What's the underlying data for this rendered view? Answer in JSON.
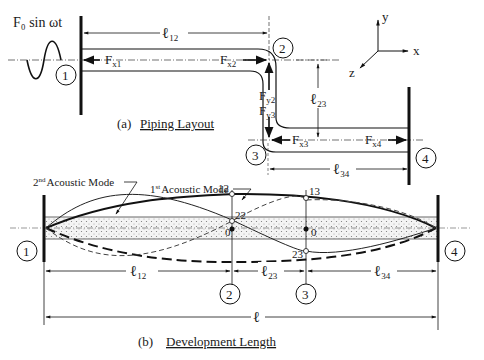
{
  "figure": {
    "excitation_label": "F₀ sin ωt",
    "axes": {
      "x": "x",
      "y": "y",
      "z": "z"
    },
    "part_a": {
      "caption_prefix": "(a)",
      "caption_title": "Piping Layout",
      "nodes": [
        "1",
        "2",
        "3",
        "4"
      ],
      "lengths": {
        "l12": "12",
        "l23": "23",
        "l34": "34"
      },
      "length_symbol": "ℓ",
      "forces": [
        {
          "base": "F",
          "sub": "x1"
        },
        {
          "base": "F",
          "sub": "x2"
        },
        {
          "base": "F",
          "sub": "y2"
        },
        {
          "base": "F",
          "sub": "y3"
        },
        {
          "base": "F",
          "sub": "x3"
        },
        {
          "base": "F",
          "sub": "x4"
        }
      ]
    },
    "part_b": {
      "caption_prefix": "(b)",
      "caption_title": "Development Length",
      "mode2_label": "Acoustic Mode",
      "mode2_ordinal": "2",
      "mode2_sup": "nd",
      "mode1_label": "Acoustic Mode",
      "mode1_ordinal": "1",
      "mode1_sup": "st",
      "point_labels": {
        "p12": "12",
        "p13": "13",
        "p22": "22",
        "p23": "23",
        "zero_a": "0",
        "zero_b": "0"
      },
      "nodes": [
        "1",
        "2",
        "3",
        "4"
      ],
      "total_length": "ℓ"
    }
  }
}
